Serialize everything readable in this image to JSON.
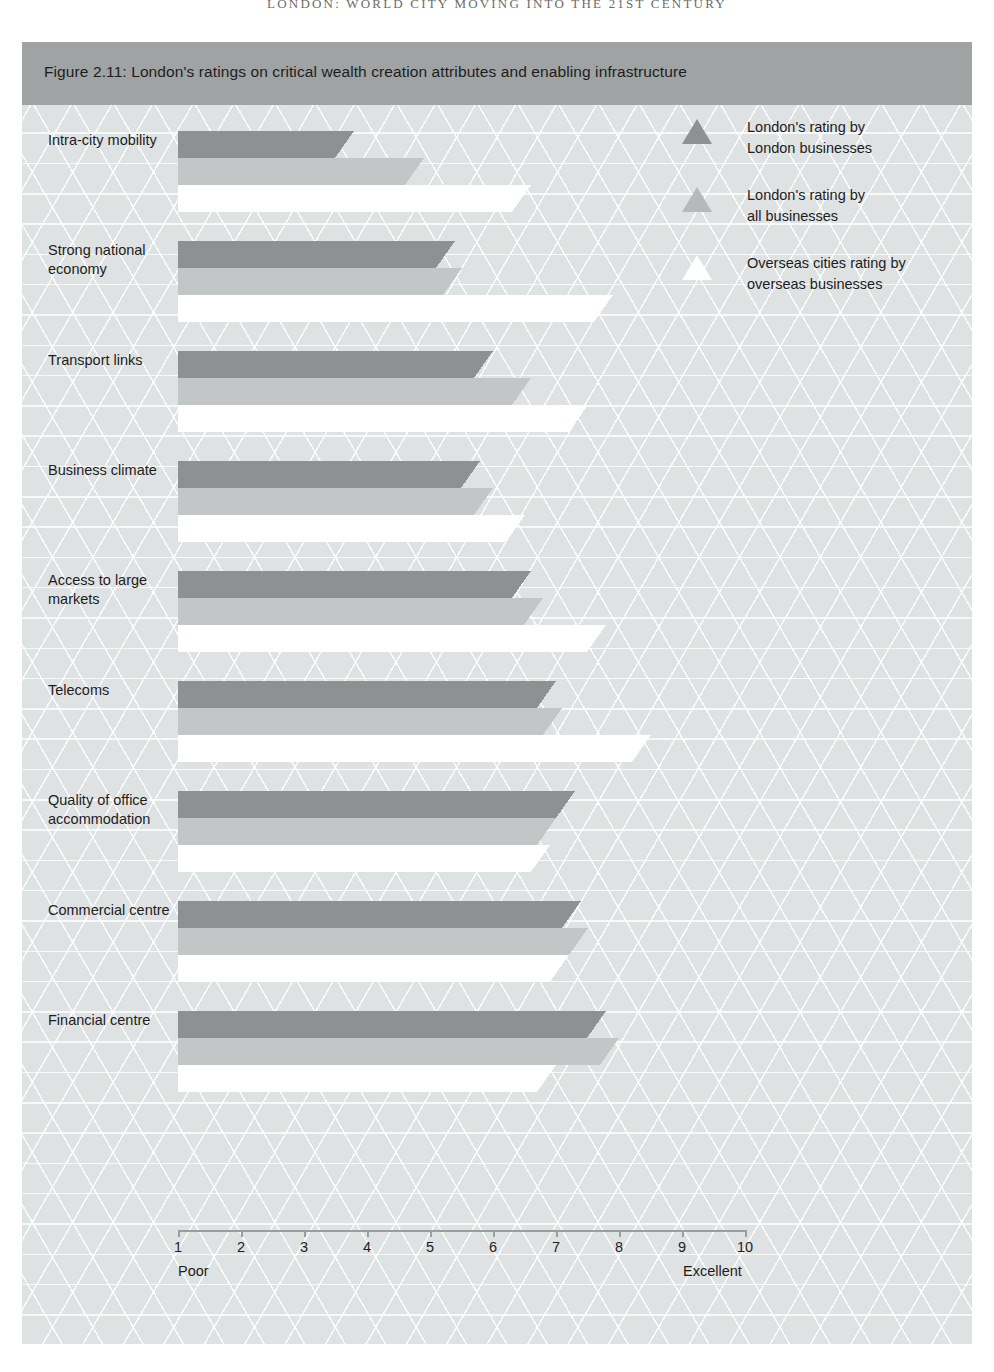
{
  "running_head": "LONDON: WORLD CITY MOVING INTO THE 21ST CENTURY",
  "figure": {
    "caption": "Figure 2.11: London's ratings on critical wealth creation attributes and enabling infrastructure",
    "source": "RICHARD ELLIS. LONDON WORLD CITY SURVEY"
  },
  "legend": {
    "position": "top-right",
    "items": [
      {
        "label": "London's rating by\nLondon businesses",
        "color": "#8d9192",
        "marker": "triangle-icon"
      },
      {
        "label": "London's rating by\nall businesses",
        "color": "#b5b9ba",
        "marker": "triangle-icon"
      },
      {
        "label": "Overseas cities rating by\noverseas businesses",
        "color": "#ffffff",
        "marker": "triangle-icon"
      }
    ]
  },
  "axis": {
    "ticks": [
      "1",
      "2",
      "3",
      "4",
      "5",
      "6",
      "7",
      "8",
      "9",
      "10"
    ],
    "low_label": "Poor",
    "high_label": "Excellent",
    "min": 1,
    "max": 10
  },
  "chart_data": {
    "type": "bar",
    "orientation": "horizontal",
    "title": "Figure 2.11: London's ratings on critical wealth creation attributes and enabling infrastructure",
    "xlabel": "",
    "ylabel": "",
    "xlim": [
      1,
      10
    ],
    "grid": false,
    "legend_position": "top-right",
    "annotations": [
      "Poor",
      "Excellent"
    ],
    "categories": [
      "Intra-city mobility",
      "Strong national economy",
      "Transport links",
      "Business climate",
      "Access to large markets",
      "Telecoms",
      "Quality of office accommodation",
      "Commercial centre",
      "Financial centre"
    ],
    "series": [
      {
        "name": "London's rating by London businesses",
        "color": "#8d9192",
        "values": [
          3.8,
          5.4,
          6.0,
          5.8,
          6.6,
          7.0,
          7.3,
          7.4,
          7.8
        ]
      },
      {
        "name": "London's rating by all businesses",
        "color": "#c2c6c7",
        "values": [
          4.9,
          5.5,
          6.6,
          6.0,
          6.8,
          7.1,
          7.0,
          7.5,
          8.0
        ]
      },
      {
        "name": "Overseas cities rating by overseas businesses",
        "color": "#ffffff",
        "values": [
          6.6,
          7.9,
          7.5,
          6.5,
          7.8,
          8.5,
          6.9,
          7.2,
          7.0
        ]
      }
    ]
  }
}
